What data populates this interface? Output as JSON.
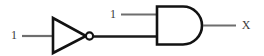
{
  "figure": {
    "kind": "logic-circuit-diagram",
    "background_color": "#ffffff",
    "wire_color": "#6e6e6e",
    "gate_outline_color": "#121212",
    "label_color": "#3a3a3a"
  },
  "labels": {
    "not_gate_input_value": "1",
    "and_gate_top_input_value": "1",
    "output_value": "X"
  },
  "gates": [
    {
      "id": "not-gate",
      "type": "NOT",
      "symbol": "inverter-triangle-with-bubble",
      "inputs": [
        "1"
      ],
      "output_feeds": "and-gate-lower-input"
    },
    {
      "id": "and-gate",
      "type": "AND",
      "symbol": "d-shape",
      "inputs": [
        "1",
        "not-gate-output"
      ],
      "output_label": "X"
    }
  ],
  "nets": [
    {
      "id": "net-in-a",
      "from": "1",
      "to": "not-gate-input"
    },
    {
      "id": "net-not-out",
      "from": "not-gate-output",
      "to": "and-gate-lower-input"
    },
    {
      "id": "net-in-b",
      "from": "1",
      "to": "and-gate-upper-input"
    },
    {
      "id": "net-out",
      "from": "and-gate-output",
      "to": "X"
    }
  ]
}
